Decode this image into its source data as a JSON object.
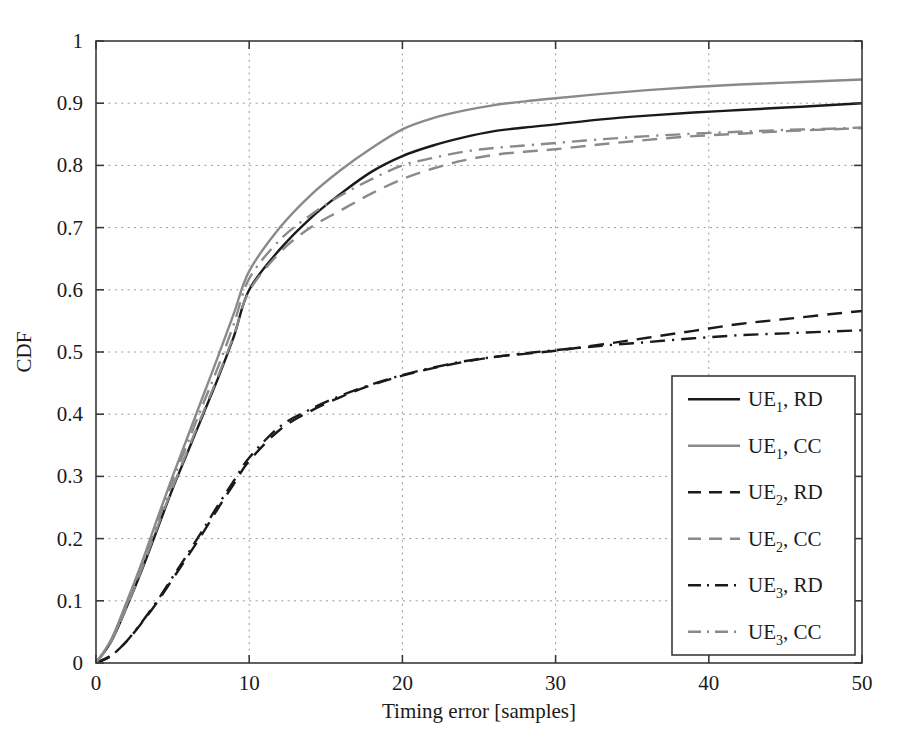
{
  "chart_data": {
    "type": "line",
    "title": "",
    "subtitle": "",
    "xlabel": "Timing error [samples]",
    "ylabel": "CDF",
    "xlim": [
      0,
      50
    ],
    "ylim": [
      0,
      1
    ],
    "xticks": [
      "0",
      "10",
      "20",
      "30",
      "40",
      "50"
    ],
    "xtick_values": [
      0,
      10,
      20,
      30,
      40,
      50
    ],
    "yticks": [
      "0",
      "0.1",
      "0.2",
      "0.3",
      "0.4",
      "0.5",
      "0.6",
      "0.7",
      "0.8",
      "0.9",
      "1"
    ],
    "ytick_values": [
      0,
      0.1,
      0.2,
      0.3,
      0.4,
      0.5,
      0.6,
      0.7,
      0.8,
      0.9,
      1
    ],
    "grid": true,
    "grid_style": "dotted",
    "legend_position": "lower right",
    "x": [
      0,
      1,
      2,
      3,
      4,
      5,
      6,
      7,
      8,
      9,
      10,
      12,
      14,
      16,
      18,
      20,
      22,
      24,
      26,
      28,
      30,
      33,
      36,
      39,
      42,
      45,
      48,
      50
    ],
    "series": [
      {
        "name": "UE1, RD",
        "label": "UE",
        "sub": "1",
        "suffix": ", RD",
        "color": "#1a1a1a",
        "dash": "none",
        "values": [
          0,
          0.035,
          0.09,
          0.15,
          0.215,
          0.28,
          0.34,
          0.4,
          0.46,
          0.525,
          0.6,
          0.665,
          0.715,
          0.755,
          0.79,
          0.815,
          0.832,
          0.845,
          0.855,
          0.861,
          0.866,
          0.874,
          0.88,
          0.885,
          0.889,
          0.893,
          0.897,
          0.9
        ]
      },
      {
        "name": "UE1, CC",
        "label": "UE",
        "sub": "1",
        "suffix": ", CC",
        "color": "#8a8a8a",
        "dash": "none",
        "values": [
          0,
          0.038,
          0.098,
          0.162,
          0.232,
          0.3,
          0.365,
          0.43,
          0.495,
          0.562,
          0.63,
          0.7,
          0.752,
          0.793,
          0.828,
          0.858,
          0.876,
          0.888,
          0.897,
          0.903,
          0.908,
          0.915,
          0.921,
          0.926,
          0.93,
          0.933,
          0.936,
          0.938
        ]
      },
      {
        "name": "UE2, RD",
        "label": "UE",
        "sub": "2",
        "suffix": ", RD",
        "color": "#1a1a1a",
        "dash": "dashed",
        "values": [
          0,
          0.012,
          0.035,
          0.065,
          0.098,
          0.135,
          0.172,
          0.21,
          0.25,
          0.288,
          0.325,
          0.375,
          0.405,
          0.428,
          0.447,
          0.462,
          0.474,
          0.484,
          0.492,
          0.497,
          0.502,
          0.512,
          0.523,
          0.534,
          0.545,
          0.553,
          0.561,
          0.566
        ]
      },
      {
        "name": "UE2, CC",
        "label": "UE",
        "sub": "2",
        "suffix": ", CC",
        "color": "#8a8a8a",
        "dash": "dashed",
        "values": [
          0,
          0.035,
          0.09,
          0.152,
          0.218,
          0.282,
          0.343,
          0.403,
          0.463,
          0.527,
          0.598,
          0.66,
          0.7,
          0.728,
          0.755,
          0.778,
          0.795,
          0.808,
          0.817,
          0.822,
          0.826,
          0.834,
          0.841,
          0.847,
          0.851,
          0.855,
          0.858,
          0.86
        ]
      },
      {
        "name": "UE3, RD",
        "label": "UE",
        "sub": "3",
        "suffix": ", RD",
        "color": "#1a1a1a",
        "dash": "dashdot",
        "values": [
          0,
          0.012,
          0.035,
          0.066,
          0.1,
          0.138,
          0.176,
          0.215,
          0.255,
          0.293,
          0.33,
          0.38,
          0.408,
          0.43,
          0.448,
          0.463,
          0.475,
          0.485,
          0.492,
          0.498,
          0.503,
          0.51,
          0.516,
          0.522,
          0.527,
          0.53,
          0.533,
          0.535
        ]
      },
      {
        "name": "UE3, CC",
        "label": "UE",
        "sub": "3",
        "suffix": ", CC",
        "color": "#8a8a8a",
        "dash": "dashdot",
        "values": [
          0,
          0.036,
          0.093,
          0.157,
          0.225,
          0.292,
          0.355,
          0.417,
          0.478,
          0.545,
          0.618,
          0.68,
          0.72,
          0.752,
          0.778,
          0.8,
          0.812,
          0.822,
          0.828,
          0.832,
          0.836,
          0.842,
          0.847,
          0.851,
          0.854,
          0.857,
          0.859,
          0.861
        ]
      }
    ]
  },
  "legend": {
    "items": [
      {
        "label": "UE",
        "sub": "1",
        "suffix": ", RD"
      },
      {
        "label": "UE",
        "sub": "1",
        "suffix": ", CC"
      },
      {
        "label": "UE",
        "sub": "2",
        "suffix": ", RD"
      },
      {
        "label": "UE",
        "sub": "2",
        "suffix": ", CC"
      },
      {
        "label": "UE",
        "sub": "3",
        "suffix": ", RD"
      },
      {
        "label": "UE",
        "sub": "3",
        "suffix": ", CC"
      }
    ]
  },
  "colors": {
    "black": "#1a1a1a",
    "gray": "#8a8a8a",
    "grid": "#999999",
    "background": "#ffffff"
  }
}
